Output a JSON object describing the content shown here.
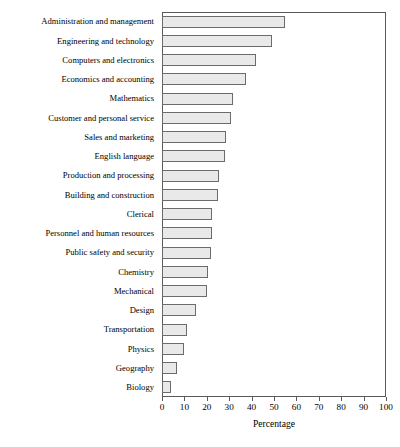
{
  "chart_data": {
    "type": "bar",
    "orientation": "horizontal",
    "title": "",
    "xlabel": "Percentage",
    "ylabel": "",
    "xlim": [
      0,
      100
    ],
    "xticks": [
      0,
      10,
      20,
      30,
      40,
      50,
      60,
      70,
      80,
      90,
      100
    ],
    "grid": false,
    "legend": false,
    "bar_fill_color": "#e9e9e9",
    "bar_edge_color": "#6b6b6b",
    "frame_color": "#5a5a5a",
    "categories": [
      "Administration and management",
      "Engineering and technology",
      "Computers and electronics",
      "Economics and accounting",
      "Mathematics",
      "Customer and personal service",
      "Sales and marketing",
      "English language",
      "Production and processing",
      "Building and construction",
      "Clerical",
      "Personnel and human resources",
      "Public safety and security",
      "Chemistry",
      "Mechanical",
      "Design",
      "Transportation",
      "Physics",
      "Geography",
      "Biology"
    ],
    "values": [
      55,
      49,
      42,
      37.5,
      31.5,
      31,
      28.5,
      28,
      25.5,
      25,
      22.5,
      22.5,
      22,
      20.5,
      20,
      15,
      11,
      10,
      6.5,
      4
    ]
  }
}
